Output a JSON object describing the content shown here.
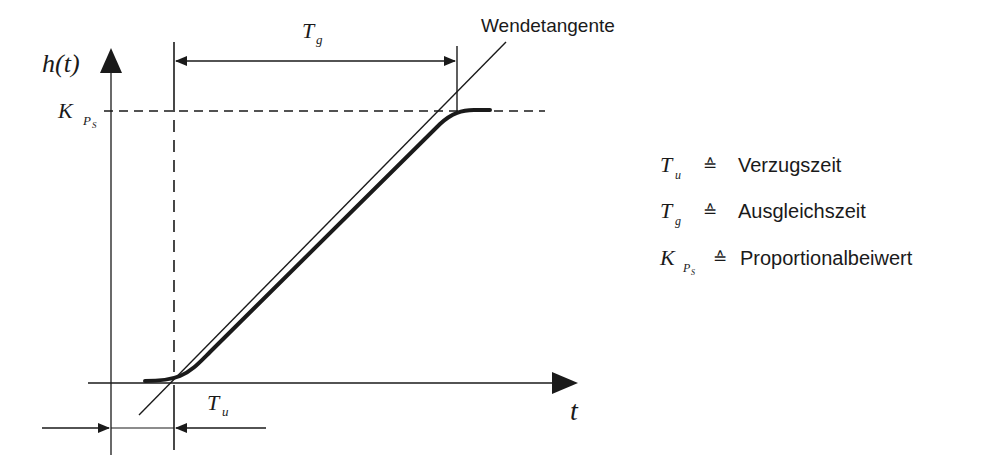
{
  "diagram": {
    "type": "step-response-tangent-method",
    "axes": {
      "y_label": "h(t)",
      "x_label": "t"
    },
    "levels": {
      "steady_state": {
        "symbol": "K",
        "subscript": "P",
        "subsubscript": "S"
      }
    },
    "annotations": {
      "tangent_label": "Wendetangente",
      "Tg": {
        "symbol": "T",
        "subscript": "g"
      },
      "Tu": {
        "symbol": "T",
        "subscript": "u"
      }
    },
    "legend": {
      "relation": "≙",
      "items": [
        {
          "symbol": "T",
          "subscript": "u",
          "subsubscript": "",
          "meaning": "Verzugszeit"
        },
        {
          "symbol": "T",
          "subscript": "g",
          "subsubscript": "",
          "meaning": "Ausgleichszeit"
        },
        {
          "symbol": "K",
          "subscript": "P",
          "subsubscript": "S",
          "meaning": "Proportionalbeiwert"
        }
      ]
    },
    "colors": {
      "ink": "#1a1a1a",
      "background": "#ffffff"
    }
  }
}
